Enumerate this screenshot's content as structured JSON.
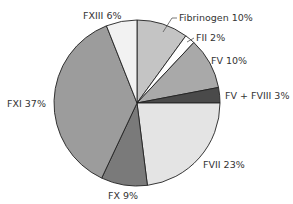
{
  "chart_data": {
    "type": "pie",
    "title": "",
    "start_angle_deg": 0,
    "direction": "clockwise",
    "slices": [
      {
        "label": "Fibrinogen",
        "value": 10,
        "text": "Fibrinogen 10%",
        "color": "#c4c4c4"
      },
      {
        "label": "FII",
        "value": 2,
        "text": "FII 2%",
        "color": "#ffffff"
      },
      {
        "label": "FV",
        "value": 10,
        "text": "FV 10%",
        "color": "#a9a9a9"
      },
      {
        "label": "FV + FVIII",
        "value": 3,
        "text": "FV + FVIII 3%",
        "color": "#4a4a4a"
      },
      {
        "label": "FVII",
        "value": 23,
        "text": "FVII 23%",
        "color": "#e4e4e4"
      },
      {
        "label": "FX",
        "value": 9,
        "text": "FX 9%",
        "color": "#7a7a7a"
      },
      {
        "label": "FXI",
        "value": 37,
        "text": "FXI 37%",
        "color": "#9c9c9c"
      },
      {
        "label": "FXIII",
        "value": 6,
        "text": "FXIII 6%",
        "color": "#f2f2f2"
      }
    ],
    "categories": [
      "Fibrinogen",
      "FII",
      "FV",
      "FV + FVIII",
      "FVII",
      "FX",
      "FXI",
      "FXIII"
    ],
    "values": [
      10,
      2,
      10,
      3,
      23,
      9,
      37,
      6
    ],
    "unit": "%"
  },
  "labels": {
    "fibrinogen": "Fibrinogen 10%",
    "fii": "FII 2%",
    "fv": "FV 10%",
    "fv_fviii": "FV + FVIII 3%",
    "fvii": "FVII 23%",
    "fx": "FX 9%",
    "fxi": "FXI 37%",
    "fxiii": "FXIII 6%"
  }
}
